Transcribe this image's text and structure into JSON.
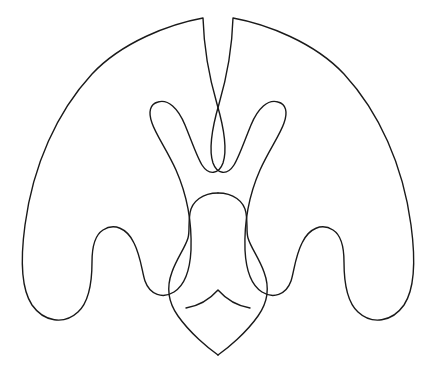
{
  "document": {
    "title": "Symmetric Ornamental Line Drawing",
    "type": "line-art-illustration",
    "subject": "bat-like winged ornament with central vase motif"
  },
  "canvas": {
    "width": 436,
    "height": 380,
    "background_color": "#ffffff"
  },
  "style": {
    "stroke_color": "#1a1a1a",
    "stroke_width": 1.4,
    "fill": "none",
    "line_cap": "round",
    "line_join": "round"
  },
  "figure": {
    "name": "winged-ornament",
    "symmetry": "bilateral-vertical",
    "axis_of_symmetry_x": 218,
    "bounds": {
      "left": 23,
      "right": 413,
      "top": 18,
      "bottom": 355
    }
  },
  "shapes": [
    {
      "name": "outer-silhouette",
      "description": "Large arching outline with two scalloped wing lobes on each side and two inner flame tips rising to twin apexes at top center",
      "path": "M 203 18 C 170 24 122 42 92 74 C 57 112 33 165 25 225 C 20 262 22 290 32 305 C 44 322 64 325 78 312 C 89 302 92 284 92 262 C 92 245 95 235 103 230 C 114 223 127 228 134 243 C 141 257 142 272 145 281 C 150 295 163 299 174 292 C 185 285 190 270 191 250 C 192 222 187 195 176 170 C 167 150 156 135 152 123 C 148 112 150 104 158 102 C 168 99 178 108 185 125 C 192 142 197 157 202 165 C 209 176 219 174 223 163 C 227 151 224 128 217 104 C 210 80 204 52 203 18 Z"
    },
    {
      "name": "outer-silhouette-mirror",
      "description": "Mirror image of the outer silhouette for the right half",
      "mirror_of": "outer-silhouette"
    },
    {
      "name": "central-ornament",
      "description": "Vase or bowling-pin shaped body with rounded dome head, pinched neck, bulbous lower body and a pointed bottom tip",
      "path": "M 218 193 C 203 193 192 201 190 213 C 188 224 190 231 188 238 C 185 248 177 258 172 272 C 166 288 168 302 178 316 C 190 333 208 348 218 355"
    },
    {
      "name": "chevron-detail",
      "description": "Curved chevron line crossing the lower body of the central ornament, apex pointing upward",
      "apex": {
        "x": 218,
        "y": 290
      },
      "left_end": {
        "x": 186,
        "y": 308
      },
      "right_end": {
        "x": 250,
        "y": 308
      },
      "path": "M 186 308 C 198 306 210 299 218 290 C 226 299 238 306 250 308"
    }
  ],
  "key_points": {
    "top_apex_left": {
      "x": 203,
      "y": 18
    },
    "top_apex_right": {
      "x": 232,
      "y": 18
    },
    "inner_flame_tip_left": {
      "x": 191,
      "y": 170
    },
    "inner_flame_tip_right": {
      "x": 245,
      "y": 170
    },
    "inner_lobe_peak_left": {
      "x": 152,
      "y": 119
    },
    "inner_lobe_peak_right": {
      "x": 284,
      "y": 119
    },
    "wing_notch_peak_left": {
      "x": 92,
      "y": 233
    },
    "wing_notch_peak_right": {
      "x": 344,
      "y": 233
    },
    "wing_valley_left": {
      "x": 140,
      "y": 285
    },
    "wing_valley_right": {
      "x": 296,
      "y": 285
    },
    "outer_lobe_bottom_left": {
      "x": 44,
      "y": 312
    },
    "outer_lobe_bottom_right": {
      "x": 392,
      "y": 312
    },
    "ornament_head_top": {
      "x": 218,
      "y": 193
    },
    "ornament_neck": {
      "x": 218,
      "y": 232
    },
    "ornament_widest": {
      "y": 272,
      "left_x": 182,
      "right_x": 254
    },
    "ornament_bottom_tip": {
      "x": 218,
      "y": 355
    }
  }
}
